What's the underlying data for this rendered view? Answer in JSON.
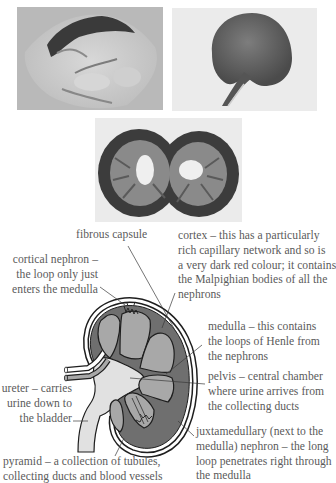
{
  "photos": [
    {
      "name": "kidney-photo-fatty-capsule",
      "caption": ""
    },
    {
      "name": "kidney-photo-whole",
      "caption": ""
    },
    {
      "name": "kidney-photo-halved",
      "caption": ""
    }
  ],
  "diagram": {
    "colors": {
      "cortex": "#6f6f6f",
      "medulla": "#a8a8a8",
      "pelvis": "#e1e1e1",
      "capsule": "#ffffff",
      "outline": "#1e1e1e",
      "text": "#5a5a5a"
    },
    "labels": {
      "fibrous_capsule": "fibrous capsule",
      "cortical_nephron": "cortical nephron –\nthe loop only just\nenters the medulla",
      "cortex": "cortex – this has a particularly\nrich capillary network and so is\na very dark red colour; it contains\nthe Malpighian bodies of all the\nnephrons",
      "medulla": "medulla – this contains\nthe loops of Henle from\nthe nephrons",
      "pelvis": "pelvis – central chamber\nwhere urine arrives from\nthe collecting ducts",
      "ureter": "ureter – carries\nurine down to\nthe bladder",
      "juxtamedullary": "juxtamedullary (next to the\nmedulla) nephron – the long\nloop penetrates right through\nthe medulla",
      "pyramid": "pyramid – a collection of tubules,\ncollecting ducts and blood vessels"
    }
  }
}
